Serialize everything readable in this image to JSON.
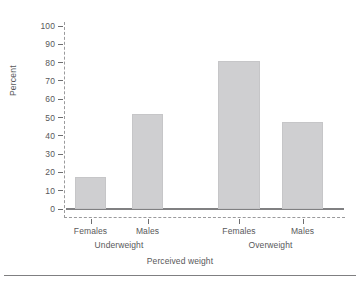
{
  "chart_data": {
    "type": "bar",
    "title": "",
    "subtitle": "",
    "xlabel": "Perceived weight",
    "ylabel": "Percent",
    "ylim": [
      0,
      100
    ],
    "yticks": [
      0,
      10,
      20,
      30,
      40,
      50,
      60,
      70,
      80,
      90,
      100
    ],
    "grid": false,
    "legend": null,
    "categories": [
      "Females",
      "Males",
      "Females",
      "Males"
    ],
    "groups": [
      {
        "label": "Underweight",
        "categories": [
          "Females",
          "Males"
        ],
        "values": [
          17.5,
          52
        ]
      },
      {
        "label": "Overweight",
        "categories": [
          "Females",
          "Males"
        ],
        "values": [
          81,
          47.5
        ]
      }
    ],
    "values": [
      17.5,
      52,
      81,
      47.5
    ],
    "bars": [
      {
        "category": "Females",
        "group": "Underweight",
        "value": 17.5
      },
      {
        "category": "Males",
        "group": "Underweight",
        "value": 52
      },
      {
        "category": "Females",
        "group": "Overweight",
        "value": 81
      },
      {
        "category": "Males",
        "group": "Overweight",
        "value": 47.5
      }
    ],
    "colors": {
      "bar_fill": "#cfcfd1",
      "bar_edge": "#c6c6c8",
      "axis": "#9a9a9c",
      "baseline": "#808082",
      "text": "#58585a",
      "background": "#ffffff"
    }
  },
  "axis": {
    "y_title": "Percent",
    "x_title": "Perceived weight",
    "y_tick_labels": [
      "100",
      "90",
      "80",
      "70",
      "60",
      "50",
      "40",
      "30",
      "20",
      "10",
      "0"
    ]
  }
}
